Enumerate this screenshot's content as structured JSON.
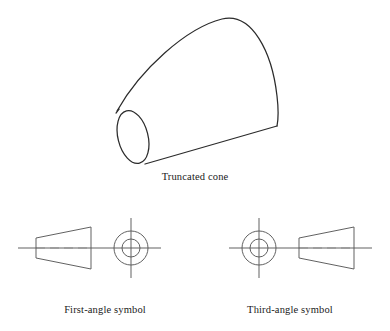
{
  "figure": {
    "background_color": "#ffffff",
    "line_color": "#2b2b2b",
    "symbol_line_color": "#595959",
    "text_color": "#1a1a1a"
  },
  "pictorial": {
    "name": "truncated-cone",
    "caption": "Truncated cone",
    "description": "Isometric pictorial of a truncated cone (frustum) with small circular face at lower left and large circular face at upper right",
    "small_face": {
      "center_x": 133,
      "center_y": 137,
      "radius_x": 15,
      "radius_y": 27,
      "rotation_deg": -14
    },
    "large_face": {
      "apex_x": 222,
      "apex_y": 19,
      "end_x": 277,
      "end_y": 126
    },
    "upper_edge": {
      "x1": 117,
      "y1": 111,
      "x2": 222,
      "y2": 19
    },
    "lower_edge": {
      "x1": 145,
      "y1": 164,
      "x2": 277,
      "y2": 126
    }
  },
  "symbols": [
    {
      "name": "first-angle-symbol",
      "caption": "First-angle symbol",
      "order": "frustum-left-circles-right",
      "frustum": {
        "small_end_x": 36,
        "large_end_x": 91,
        "small_half_height": 10,
        "large_half_height": 21,
        "center_y": 248
      },
      "circles": {
        "center_x": 131,
        "center_y": 248,
        "outer_radius": 17,
        "inner_radius": 9
      },
      "centerline": {
        "x1": 18,
        "x2": 161,
        "y": 248
      },
      "vertical_centerline": {
        "x": 131,
        "y1": 218,
        "y2": 278
      }
    },
    {
      "name": "third-angle-symbol",
      "caption": "Third-angle symbol",
      "order": "circles-left-frustum-right",
      "frustum": {
        "small_end_x": 299,
        "large_end_x": 354,
        "small_half_height": 10,
        "large_half_height": 21,
        "center_y": 248
      },
      "circles": {
        "center_x": 259,
        "center_y": 248,
        "outer_radius": 17,
        "inner_radius": 9
      },
      "centerline": {
        "x1": 229,
        "x2": 372,
        "y": 248
      },
      "vertical_centerline": {
        "x": 259,
        "y1": 218,
        "y2": 278
      }
    }
  ]
}
